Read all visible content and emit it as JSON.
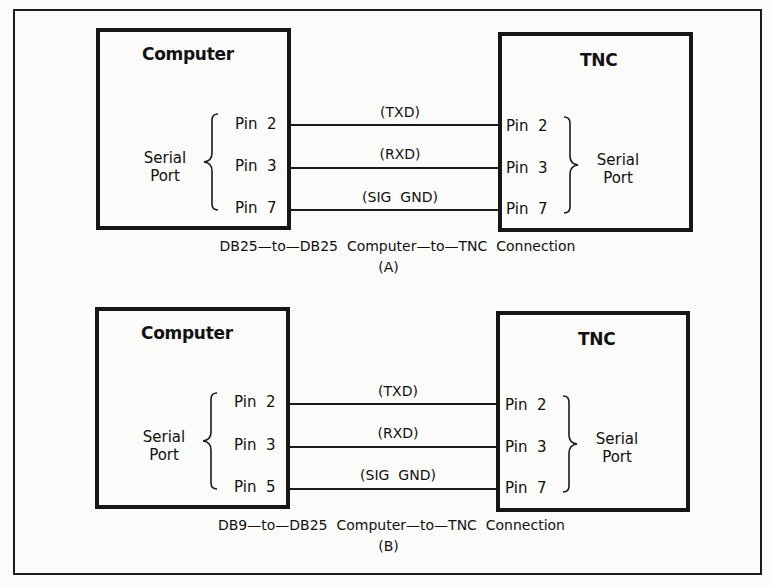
{
  "diagrams": [
    {
      "id": "A",
      "left_box": {
        "title": "Computer",
        "port_label_line1": "Serial",
        "port_label_line2": "Port",
        "pins": [
          "Pin  2",
          "Pin  3",
          "Pin  7"
        ]
      },
      "right_box": {
        "title": "TNC",
        "port_label_line1": "Serial",
        "port_label_line2": "Port",
        "pins": [
          "Pin  2",
          "Pin  3",
          "Pin  7"
        ]
      },
      "signals": [
        "(TXD)",
        "(RXD)",
        "(SIG  GND)"
      ],
      "caption": "DB25—to—DB25  Computer—to—TNC  Connection",
      "label": "(A)"
    },
    {
      "id": "B",
      "left_box": {
        "title": "Computer",
        "port_label_line1": "Serial",
        "port_label_line2": "Port",
        "pins": [
          "Pin  2",
          "Pin  3",
          "Pin  5"
        ]
      },
      "right_box": {
        "title": "TNC",
        "port_label_line1": "Serial",
        "port_label_line2": "Port",
        "pins": [
          "Pin  2",
          "Pin  3",
          "Pin  7"
        ]
      },
      "signals": [
        "(TXD)",
        "(RXD)",
        "(SIG  GND)"
      ],
      "caption": "DB9—to—DB25  Computer—to—TNC  Connection",
      "label": "(B)"
    }
  ],
  "colors": {
    "line": "#1a1a1a",
    "background": "#fbfbfa"
  }
}
